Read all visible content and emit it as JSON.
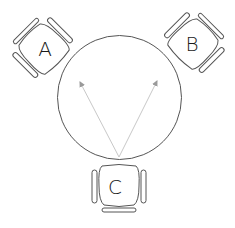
{
  "diagram": {
    "title": "",
    "table": {
      "shape": "circle",
      "center": [
        119.5,
        97.5
      ],
      "radius": 62,
      "stroke": "#555555"
    },
    "chairs": [
      {
        "label": "A",
        "center": [
          43,
          48
        ],
        "rotation": -45
      },
      {
        "label": "B",
        "center": [
          194,
          43
        ],
        "rotation": 45
      },
      {
        "label": "C",
        "center": [
          119,
          186
        ],
        "rotation": 0
      }
    ],
    "arrows": [
      {
        "from_chair": "C",
        "to": "A",
        "start": [
          119,
          157
        ],
        "end": [
          80,
          82
        ]
      },
      {
        "from_chair": "C",
        "to": "B",
        "start": [
          119,
          157
        ],
        "end": [
          157,
          81
        ]
      }
    ],
    "colors": {
      "outline": "#555555",
      "arrow": "#c8c8c8",
      "text": "#1a1a1a"
    }
  }
}
